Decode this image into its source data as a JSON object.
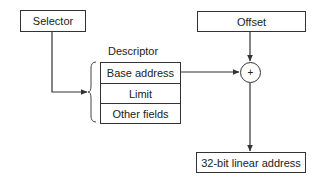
{
  "diagram": {
    "selector": {
      "label": "Selector"
    },
    "offset": {
      "label": "Offset"
    },
    "descriptor": {
      "title": "Descriptor",
      "fields": [
        {
          "label": "Base address"
        },
        {
          "label": "Limit"
        },
        {
          "label": "Other fields"
        }
      ]
    },
    "adder": {
      "symbol": "+"
    },
    "output": {
      "label": "32-bit linear address"
    },
    "colors": {
      "stroke": "#333333",
      "text": "#222222",
      "background": "#ffffff"
    },
    "connections": [
      {
        "from": "selector",
        "to": "descriptor",
        "type": "arrow"
      },
      {
        "from": "descriptor.base_address",
        "to": "adder",
        "type": "arrow"
      },
      {
        "from": "offset",
        "to": "adder",
        "type": "arrow"
      },
      {
        "from": "adder",
        "to": "output",
        "type": "arrow"
      }
    ]
  }
}
